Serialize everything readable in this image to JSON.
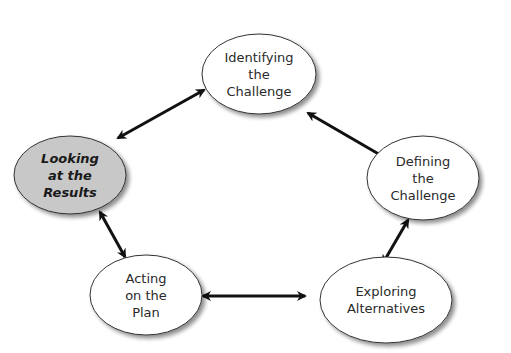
{
  "diagram": {
    "type": "cycle",
    "colors": {
      "node_fill": "#ffffff",
      "highlight_fill": "#c8c8c8",
      "stroke": "#333333",
      "arrow": "#111111",
      "shadow": "#9a9a9a"
    },
    "nodes": [
      {
        "id": "identifying",
        "lines": [
          "Identifying",
          "the",
          "Challenge"
        ],
        "highlighted": false,
        "cx": 259,
        "cy": 74,
        "rx": 57,
        "ry": 40
      },
      {
        "id": "defining",
        "lines": [
          "Defining",
          "the",
          "Challenge"
        ],
        "highlighted": false,
        "cx": 423,
        "cy": 178,
        "rx": 56,
        "ry": 42
      },
      {
        "id": "exploring",
        "lines": [
          "Exploring",
          "Alternatives"
        ],
        "highlighted": false,
        "cx": 386,
        "cy": 300,
        "rx": 66,
        "ry": 43
      },
      {
        "id": "acting",
        "lines": [
          "Acting",
          "on the",
          "Plan"
        ],
        "highlighted": false,
        "cx": 146,
        "cy": 295,
        "rx": 56,
        "ry": 40
      },
      {
        "id": "looking",
        "lines": [
          "Looking",
          "at the",
          "Results"
        ],
        "highlighted": true,
        "cx": 70,
        "cy": 175,
        "rx": 56,
        "ry": 39
      }
    ],
    "edges": [
      {
        "from": "identifying",
        "to": "defining",
        "bidirectional": true,
        "x1": 308,
        "y1": 113,
        "x2": 389,
        "y2": 160
      },
      {
        "from": "defining",
        "to": "exploring",
        "bidirectional": true,
        "x1": 408,
        "y1": 220,
        "x2": 383,
        "y2": 263
      },
      {
        "from": "exploring",
        "to": "acting",
        "bidirectional": true,
        "x1": 305,
        "y1": 296,
        "x2": 203,
        "y2": 296
      },
      {
        "from": "acting",
        "to": "looking",
        "bidirectional": true,
        "x1": 125,
        "y1": 257,
        "x2": 100,
        "y2": 212
      },
      {
        "from": "looking",
        "to": "identifying",
        "bidirectional": true,
        "x1": 118,
        "y1": 138,
        "x2": 204,
        "y2": 90
      }
    ]
  }
}
